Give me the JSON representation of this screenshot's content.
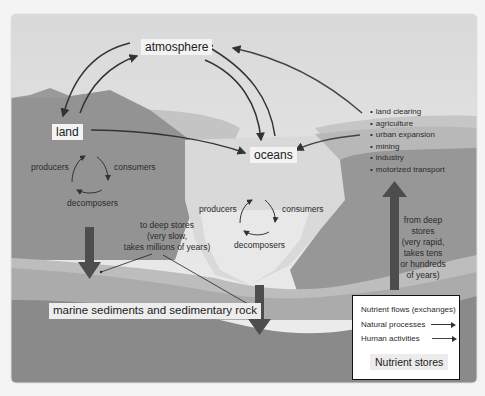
{
  "diagram": {
    "title_nodes": {
      "atmosphere": "atmosphere",
      "land": "land",
      "oceans": "oceans",
      "sediments": "marine sediments and sedimentary rock"
    },
    "land_cycle": {
      "producers": "producers",
      "consumers": "consumers",
      "decomposers": "decomposers"
    },
    "ocean_cycle": {
      "producers": "producers",
      "consumers": "consumers",
      "decomposers": "decomposers"
    },
    "to_deep_stores": "to deep stores\n(very slow,\ntakes millions of years)",
    "from_deep_stores": "from deep\nstores\n(very rapid,\ntakes tens\nor hundreds\nof years)",
    "human_activities": [
      "land clearing",
      "agriculture",
      "urban expansion",
      "mining",
      "industry",
      "motorized transport"
    ],
    "legend": {
      "title": "Nutrient flows (exchanges)",
      "natural": "Natural processes",
      "human": "Human activities",
      "stores": "Nutrient stores"
    },
    "colors": {
      "sky": "#e6e6e6",
      "land_dark": "#8f8f8f",
      "land_mid": "#a3a3a3",
      "water": "#d2d2d2",
      "sediment_band": "#b5b5b5",
      "bedrock": "#858585",
      "arrow_natural": "#3a3a3a",
      "arrow_human": "#4a4a4a",
      "deep_arrow": "#4d4d4d"
    }
  }
}
